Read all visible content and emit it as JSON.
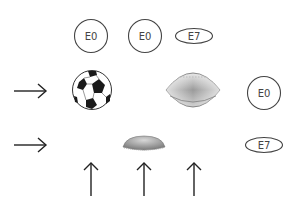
{
  "puzzle": {
    "column_labels": [
      "E0",
      "E0",
      "E7"
    ],
    "row_labels": [
      "E0",
      "E7"
    ],
    "rows": [
      {
        "arrow": "right-arrow",
        "items": [
          "soccer-ball",
          "",
          "american-football"
        ]
      },
      {
        "arrow": "right-arrow",
        "items": [
          "",
          "flattened-ball",
          ""
        ]
      }
    ],
    "bottom_arrows": [
      "up-arrow",
      "up-arrow",
      "up-arrow"
    ]
  },
  "colors": {
    "stroke": "#444444",
    "background": "#ffffff"
  }
}
